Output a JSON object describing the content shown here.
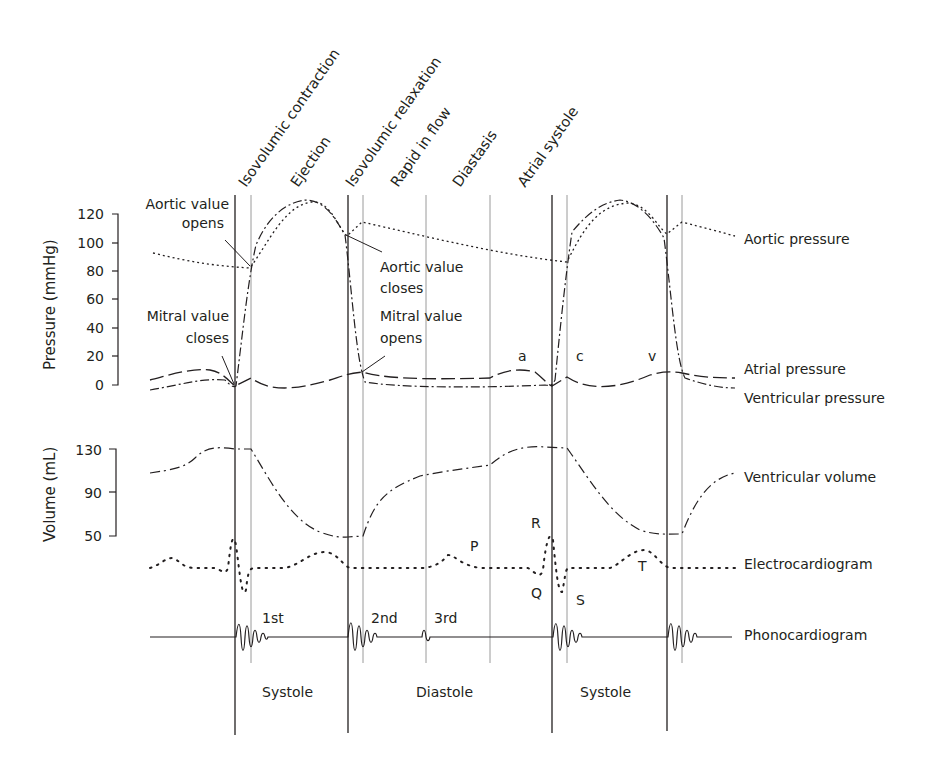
{
  "phases": [
    {
      "label": "Isovolumic contraction",
      "x": 243
    },
    {
      "label": "Ejection",
      "x": 298
    },
    {
      "label": "Isovolumic relaxation",
      "x": 356
    },
    {
      "label": "Rapid in flow",
      "x": 395
    },
    {
      "label": "Diastasis",
      "x": 458
    },
    {
      "label": "Atrial systole",
      "x": 522
    }
  ],
  "pressure_axis": {
    "label": "Pressure (mmHg)",
    "ticks": [
      "120",
      "100",
      "80",
      "60",
      "40",
      "20",
      "0"
    ]
  },
  "volume_axis": {
    "label": "Volume (mL)",
    "ticks": [
      "130",
      "90",
      "50"
    ]
  },
  "annotations": {
    "aortic_opens_1": "Aortic value",
    "aortic_opens_2": "opens",
    "mitral_closes_1": "Mitral value",
    "mitral_closes_2": "closes",
    "aortic_closes_1": "Aortic value",
    "aortic_closes_2": "closes",
    "mitral_opens_1": "Mitral value",
    "mitral_opens_2": "opens",
    "a_wave": "a",
    "c_wave": "c",
    "v_wave": "v",
    "p_wave": "P",
    "q_wave": "Q",
    "r_wave": "R",
    "s_wave": "S",
    "t_wave": "T",
    "heart_sound_1": "1st",
    "heart_sound_2": "2nd",
    "heart_sound_3": "3rd"
  },
  "legend": {
    "aortic_pressure": "Aortic pressure",
    "atrial_pressure": "Atrial pressure",
    "ventricular_pressure": "Ventricular pressure",
    "ventricular_volume": "Ventricular volume",
    "electrocardiogram": "Electrocardiogram",
    "phonocardiogram": "Phonocardiogram"
  },
  "bottom_labels": {
    "systole_1": "Systole",
    "diastole": "Diastole",
    "systole_2": "Systole"
  },
  "colors": {
    "ink": "#231f20",
    "guide_gray": "#9a9a9a"
  }
}
